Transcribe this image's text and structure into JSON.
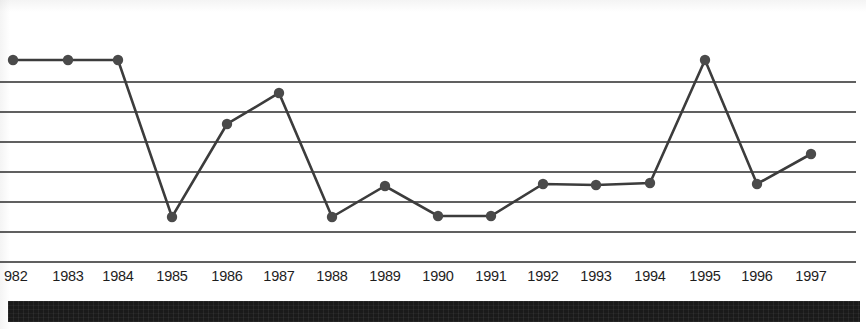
{
  "chart_data": {
    "type": "line",
    "title": "",
    "subtitle": "",
    "xlabel": "",
    "ylabel": "",
    "grid": true,
    "gridlines_count": 7,
    "legend": "none",
    "xlim": [
      1982,
      1997
    ],
    "ylim": [
      0,
      7.3
    ],
    "axis_note": "y-axis unlabeled; values estimated from 7 evenly spaced gridlines (1 unit per gridline, baseline gridline = 0)",
    "categories": [
      "1982",
      "1983",
      "1984",
      "1985",
      "1986",
      "1987",
      "1988",
      "1989",
      "1990",
      "1991",
      "1992",
      "1993",
      "1994",
      "1995",
      "1996",
      "1997"
    ],
    "tick_labels": [
      "982",
      "1983",
      "1984",
      "1985",
      "1986",
      "1987",
      "1988",
      "1989",
      "1990",
      "1991",
      "1992",
      "1993",
      "1994",
      "1995",
      "1996",
      "1997"
    ],
    "values": [
      6.73,
      6.73,
      6.73,
      1.5,
      4.6,
      5.63,
      1.5,
      2.53,
      1.53,
      1.53,
      2.6,
      2.57,
      2.63,
      6.73,
      2.6,
      3.6
    ],
    "series": [
      {
        "name": "series-1",
        "color": "#3c3c3c",
        "marker": "circle",
        "values": [
          6.73,
          6.73,
          6.73,
          1.5,
          4.6,
          5.63,
          1.5,
          2.53,
          1.53,
          1.53,
          2.6,
          2.57,
          2.63,
          6.73,
          2.6,
          3.6
        ]
      }
    ],
    "pixel_points": [
      {
        "year": "1982",
        "x": 13,
        "y": 60
      },
      {
        "year": "1983",
        "x": 68,
        "y": 60
      },
      {
        "year": "1984",
        "x": 118,
        "y": 60
      },
      {
        "year": "1985",
        "x": 172,
        "y": 217
      },
      {
        "year": "1986",
        "x": 227,
        "y": 124
      },
      {
        "year": "1987",
        "x": 279,
        "y": 93
      },
      {
        "year": "1988",
        "x": 332,
        "y": 217
      },
      {
        "year": "1989",
        "x": 385,
        "y": 186
      },
      {
        "year": "1990",
        "x": 438,
        "y": 216
      },
      {
        "year": "1991",
        "x": 491,
        "y": 216
      },
      {
        "year": "1992",
        "x": 543,
        "y": 184
      },
      {
        "year": "1993",
        "x": 596,
        "y": 185
      },
      {
        "year": "1994",
        "x": 650,
        "y": 183
      },
      {
        "year": "1995",
        "x": 705,
        "y": 60
      },
      {
        "year": "1996",
        "x": 757,
        "y": 184
      },
      {
        "year": "1997",
        "x": 811,
        "y": 154
      }
    ],
    "gridline_y": [
      82,
      112,
      142,
      172,
      202,
      232,
      262
    ],
    "gridline_color": "#2b2b2b",
    "line_color": "#3c3c3c",
    "marker_color": "#4a4a4a",
    "background_color": "#ffffff"
  },
  "footer": {
    "bar_color": "#1a1a1a"
  }
}
